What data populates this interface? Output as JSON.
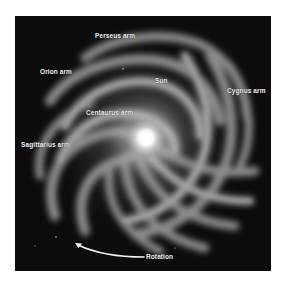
{
  "figure": {
    "background_color": "#0c0c0c",
    "page_color": "#ffffff",
    "core_color": "#ffffff",
    "arm_color": "#9a9a9a"
  },
  "labels": {
    "perseus": "Perseus arm",
    "orion": "Orion arm",
    "sun": "Sun",
    "cygnus": "Cygnus arm",
    "centaurus": "Centaurus arm",
    "sagittarius": "Sagittarius arm",
    "rotation": "Rotation"
  },
  "annotations": {
    "rotation_arrow": "curved-arrow-counterclockwise"
  }
}
